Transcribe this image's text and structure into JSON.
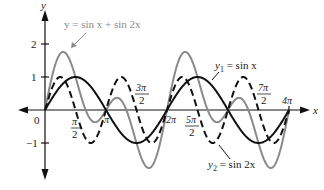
{
  "chart_data": {
    "type": "line",
    "title": "",
    "xlabel": "x",
    "ylabel": "y",
    "xlim": [
      0,
      12.566
    ],
    "ylim": [
      -1.76,
      1.76
    ],
    "grid": false,
    "legend": "inline annotations",
    "x_ticks": [
      "0",
      "π/2",
      "π",
      "3π/2",
      "2π",
      "5π/2",
      "7π/2",
      "4π"
    ],
    "y_ticks": [
      "2",
      "1",
      "-1"
    ],
    "series": [
      {
        "name": "y₁ = sin x",
        "style": "solid",
        "color": "#111111",
        "x": [
          "0",
          "π/2",
          "π",
          "3π/2",
          "2π",
          "5π/2",
          "3π",
          "7π/2",
          "4π"
        ],
        "values": [
          0,
          1,
          0,
          -1,
          0,
          1,
          0,
          -1,
          0
        ]
      },
      {
        "name": "y₂ = sin 2x",
        "style": "dashed",
        "color": "#111111",
        "x": [
          "0",
          "π/4",
          "π/2",
          "3π/4",
          "π",
          "5π/4",
          "3π/2",
          "7π/4",
          "2π",
          "9π/4",
          "5π/2",
          "11π/4",
          "3π",
          "13π/4",
          "7π/2",
          "15π/4",
          "4π"
        ],
        "values": [
          0,
          1,
          0,
          -1,
          0,
          1,
          0,
          -1,
          0,
          1,
          0,
          -1,
          0,
          1,
          0,
          -1,
          0
        ]
      },
      {
        "name": "y = sin x + sin 2x",
        "style": "solid",
        "color": "#8a8a8a",
        "x": [
          "0",
          "0.94",
          "π/2",
          "2π/3",
          "π",
          "4π/3",
          "3π/2",
          "5.34",
          "2π"
        ],
        "values": [
          0,
          1.76,
          1,
          0,
          0,
          0,
          -1,
          -1.76,
          0
        ],
        "periodic": "repeats with period 2π"
      }
    ],
    "annotations": [
      {
        "text": "y = sin x + sin 2x",
        "points_to": "sum curve peak near x≈0.94"
      },
      {
        "text": "y₁ = sin x",
        "points_to": "sin x curve"
      },
      {
        "text": "y₂ = sin 2x",
        "points_to": "sin 2x curve trough"
      }
    ]
  },
  "labels": {
    "y_axis": "y",
    "x_axis": "x",
    "origin": "0",
    "y_two": "2",
    "y_one": "1",
    "y_neg_one": "−1",
    "pi_half_num": "π",
    "pi_half_den": "2",
    "pi": "π",
    "three_pi_half_num": "3π",
    "three_pi_half_den": "2",
    "two_pi": "2π",
    "five_pi_half_num": "5π",
    "five_pi_half_den": "2",
    "seven_pi_half_num": "7π",
    "seven_pi_half_den": "2",
    "four_pi": "4π",
    "sum_label": "y = sin x + sin 2x",
    "y1_label_y": "y",
    "y1_label_sub": "1",
    "y1_label_rest": " = sin x",
    "y2_label_y": "y",
    "y2_label_sub": "2",
    "y2_label_rest": " = sin 2x"
  },
  "colors": {
    "axis": "#111111",
    "sin_x": "#111111",
    "sin_2x": "#111111",
    "sum": "#8a8a8a"
  }
}
